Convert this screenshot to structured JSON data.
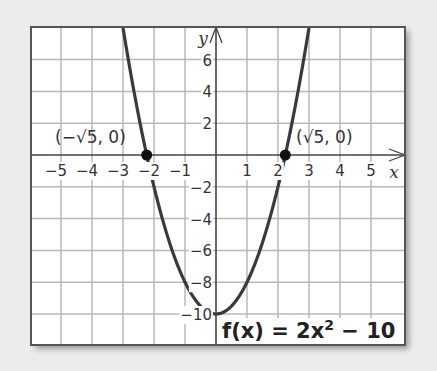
{
  "chart_data": {
    "type": "line",
    "title": "",
    "function_label": "f(x) = 2x² − 10",
    "function_parts": {
      "lhs": "f(x) = 2x",
      "exp": "2",
      "rhs": " − 10"
    },
    "xlabel": "x",
    "ylabel": "y",
    "xlim": [
      -6,
      6
    ],
    "ylim": [
      -12,
      8
    ],
    "grid": true,
    "x_ticks": [
      -5,
      -4,
      -3,
      -2,
      -1,
      1,
      2,
      3,
      4,
      5
    ],
    "x_tick_labels": [
      "−5",
      "−4",
      "−3",
      "−2",
      "−1",
      "1",
      "2",
      "3",
      "4",
      "5"
    ],
    "y_ticks": [
      6,
      4,
      2,
      -2,
      -4,
      -6,
      -8,
      -10
    ],
    "y_tick_labels": [
      "6",
      "4",
      "2",
      "−2",
      "−4",
      "−6",
      "−8",
      "−10"
    ],
    "series": [
      {
        "name": "f(x) = 2x^2 - 10",
        "x": [
          -3,
          -2.5,
          -2.236,
          -2,
          -1.5,
          -1,
          -0.5,
          0,
          0.5,
          1,
          1.5,
          2,
          2.236,
          2.5,
          3
        ],
        "y": [
          8,
          2.5,
          0,
          -2,
          -5.5,
          -8,
          -9.5,
          -10,
          -9.5,
          -8,
          -5.5,
          -2,
          0,
          2.5,
          8
        ]
      }
    ],
    "points": [
      {
        "label": "(−√5, 0)",
        "x": -2.236,
        "y": 0
      },
      {
        "label": "(√5, 0)",
        "x": 2.236,
        "y": 0
      }
    ],
    "colors": {
      "curve": "#3a3a3a",
      "grid": "#b8b8b8",
      "axes": "#444444",
      "frame": "#555555",
      "background": "#ffffff",
      "page": "#ececec"
    }
  }
}
